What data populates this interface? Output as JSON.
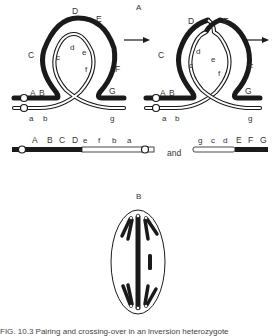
{
  "panel_labels": {
    "a": "A",
    "b": "B"
  },
  "left_loop": {
    "upper_labels": [
      "A",
      "B",
      "C",
      "D",
      "E",
      "F",
      "G"
    ],
    "lower_labels": [
      "a",
      "b",
      "c",
      "d",
      "e",
      "f",
      "g"
    ]
  },
  "right_loop": {
    "upper_labels": [
      "A",
      "B",
      "C",
      "D",
      "E",
      "F",
      "G"
    ],
    "lower_labels": [
      "a",
      "b",
      "c",
      "d",
      "e",
      "f",
      "g"
    ]
  },
  "products": {
    "first": [
      "A",
      "B",
      "C",
      "D",
      "e",
      "f",
      "b",
      "a"
    ],
    "connector": "and",
    "second": [
      "g",
      "c",
      "d",
      "E",
      "F",
      "G"
    ]
  },
  "caption": "FIG. 10.3  Pairing and crossing-over in an inversion heterozygote",
  "colors": {
    "ink": "#1a1a1a",
    "paper": "#ffffff"
  }
}
